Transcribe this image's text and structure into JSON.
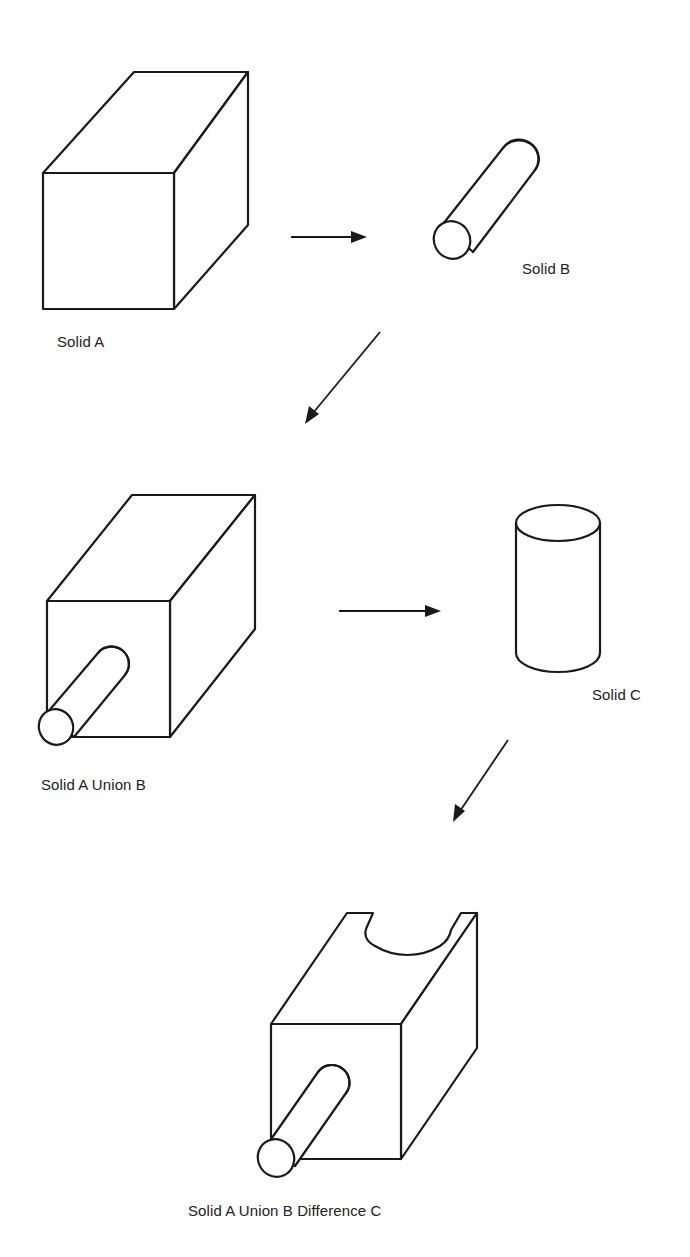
{
  "diagram": {
    "steps": [
      {
        "id": "solid-a",
        "label": "Solid A",
        "shape": "rectangular block"
      },
      {
        "id": "solid-b",
        "label": "Solid B",
        "shape": "cylinder (horizontal rod)"
      },
      {
        "id": "solid-a-union-b",
        "label": "Solid A Union B",
        "shape": "block with protruding rod"
      },
      {
        "id": "solid-c",
        "label": "Solid C",
        "shape": "cylinder (vertical)"
      },
      {
        "id": "solid-a-union-b-difference-c",
        "label": "Solid A Union B Difference C",
        "shape": "block with rod and cylindrical notch on top"
      }
    ],
    "arrows": [
      {
        "from": "solid-a",
        "to": "solid-b",
        "direction": "right"
      },
      {
        "from": "solid-b",
        "to": "solid-a-union-b",
        "direction": "down-left"
      },
      {
        "from": "solid-a-union-b",
        "to": "solid-c",
        "direction": "right"
      },
      {
        "from": "solid-c",
        "to": "solid-a-union-b-difference-c",
        "direction": "down-left"
      }
    ],
    "colors": {
      "line": "#1a1a1a",
      "background": "#ffffff",
      "text": "#222222"
    }
  }
}
